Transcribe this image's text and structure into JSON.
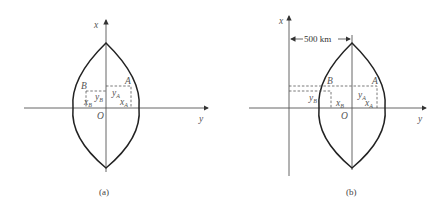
{
  "panels": [
    {
      "caption": "(a)",
      "axis_x_label": "x",
      "axis_y_label": "y",
      "origin_label": "O",
      "point_a_label": "A",
      "point_b_label": "B",
      "xA": "x",
      "xA_sub": "A",
      "yA": "y",
      "yA_sub": "A",
      "xB": "x",
      "xB_sub": "B",
      "yB": "y",
      "yB_sub": "B"
    },
    {
      "caption": "(b)",
      "axis_x_label": "x",
      "axis_y_label": "y",
      "origin_label": "O",
      "point_a_label": "A",
      "point_b_label": "B",
      "distance_label": "500 km",
      "xA": "x",
      "xA_sub": "A",
      "yA": "y",
      "yA_sub": "A",
      "xB": "x",
      "xB_sub": "B",
      "yB": "y",
      "yB_sub": "B"
    }
  ],
  "colors": {
    "line": "#222222",
    "axis": "#555555",
    "background": "#ffffff"
  }
}
